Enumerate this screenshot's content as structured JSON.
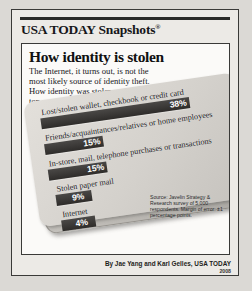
{
  "brand": {
    "name": "USA TODAY Snapshots",
    "registered_mark": "®"
  },
  "headline": "How identity is stolen",
  "deck": [
    "The Internet, it turns out, is not the",
    "most likely source of identity theft.",
    "How identity was stolen,",
    "top responses:"
  ],
  "source_note": "Source: Javelin Strategy & Research survey of 5,000 respondents. Margin of error: ±1 percentage points.",
  "credit": "By Jae Yang and Karl Gelles, USA TODAY",
  "year": "2008",
  "colors": {
    "bar": "#3b3937",
    "card": "#d4d1cc",
    "panel": "#fbfaf8",
    "frame": "#3a3a38",
    "pct_text": "#ffffff"
  },
  "chart_data": {
    "type": "bar",
    "orientation": "horizontal",
    "title": "How identity is stolen",
    "subtitle": "The Internet, it turns out, is not the most likely source of identity theft. How identity was stolen, top responses:",
    "xlabel": "",
    "ylabel": "",
    "unit": "percent",
    "xlim": [
      0,
      38
    ],
    "grid": false,
    "legend": null,
    "categories": [
      "Lost/stolen wallet, checkbook or credit card",
      "Friends/acquaintances/relatives or home employees",
      "In-store, mail, telephone purchases or transactions",
      "Stolen paper mail",
      "Internet"
    ],
    "values": [
      38,
      15,
      15,
      9,
      4
    ],
    "value_labels": [
      "38%",
      "15%",
      "15%",
      "9%",
      "4%"
    ],
    "source": "Source: Javelin Strategy & Research survey of 5,000 respondents. Margin of error: ±1 percentage points."
  }
}
